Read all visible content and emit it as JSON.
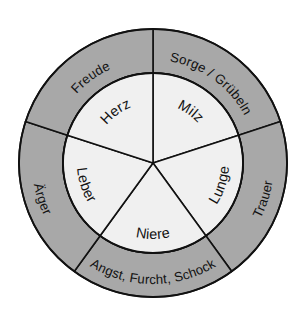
{
  "diagram": {
    "background_color": "#ffffff",
    "outer_ring_color": "#a8a8a8",
    "inner_disc_color": "#f0f0f0",
    "line_color": "#111111",
    "center_x": 153,
    "center_y": 163,
    "outer_radius": 134,
    "inner_radius": 90,
    "segment_count": 5,
    "segments": [
      {
        "index": 0,
        "organ": "Milz",
        "emotion": "Sorge / Grübeln",
        "start_angle_deg": 0,
        "end_angle_deg": 72
      },
      {
        "index": 1,
        "organ": "Lunge",
        "emotion": "Trauer",
        "start_angle_deg": 72,
        "end_angle_deg": 144
      },
      {
        "index": 2,
        "organ": "Niere",
        "emotion": "Angst, Furcht, Schock",
        "start_angle_deg": 144,
        "end_angle_deg": 216
      },
      {
        "index": 3,
        "organ": "Leber",
        "emotion": "Ärger",
        "start_angle_deg": 216,
        "end_angle_deg": 288
      },
      {
        "index": 4,
        "organ": "Herz",
        "emotion": "Freude",
        "start_angle_deg": 288,
        "end_angle_deg": 360
      }
    ]
  }
}
